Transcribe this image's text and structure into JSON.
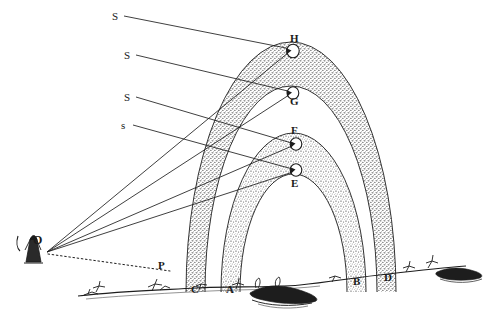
{
  "figure": {
    "ink_color": "#1d1d1d",
    "stipple_color": "#3a3a3a",
    "background": "#ffffff"
  },
  "sun_ray_labels": [
    {
      "id": "s1",
      "text": "S",
      "x": 112,
      "y": 11
    },
    {
      "id": "s2",
      "text": "S",
      "x": 124,
      "y": 50
    },
    {
      "id": "s3",
      "text": "S",
      "x": 124,
      "y": 92
    },
    {
      "id": "s4",
      "text": "s",
      "x": 121,
      "y": 120
    }
  ],
  "drop_labels": [
    {
      "id": "H",
      "text": "H",
      "x": 290,
      "y": 33
    },
    {
      "id": "G",
      "text": "G",
      "x": 290,
      "y": 96
    },
    {
      "id": "F",
      "text": "F",
      "x": 291,
      "y": 125
    },
    {
      "id": "E",
      "text": "E",
      "x": 291,
      "y": 178
    }
  ],
  "ground_labels": [
    {
      "id": "C",
      "text": "C",
      "x": 191,
      "y": 284
    },
    {
      "id": "A",
      "text": "A",
      "x": 226,
      "y": 284
    },
    {
      "id": "B",
      "text": "B",
      "x": 353,
      "y": 276
    },
    {
      "id": "D",
      "text": "D",
      "x": 384,
      "y": 272
    }
  ],
  "observer": {
    "label": "O",
    "label_x": 33,
    "label_y": 234,
    "eye_x": 46,
    "eye_y": 253
  },
  "horizon_point": {
    "label": "P",
    "label_x": 158,
    "label_y": 260
  },
  "arcs": {
    "secondary": {
      "name": "secondary-bow",
      "left_foot_label": "C",
      "right_foot_label": "D",
      "outer_left_x": 186,
      "outer_right_x": 396,
      "apex_y": 42
    },
    "primary": {
      "name": "primary-bow",
      "left_foot_label": "A",
      "right_foot_label": "B",
      "outer_left_x": 221,
      "outer_right_x": 366,
      "apex_y": 133
    }
  },
  "rays": [
    {
      "from": "S",
      "to": "H"
    },
    {
      "from": "S",
      "to": "G"
    },
    {
      "from": "S",
      "to": "F"
    },
    {
      "from": "s",
      "to": "E"
    },
    {
      "from": "H",
      "to": "O"
    },
    {
      "from": "G",
      "to": "O"
    },
    {
      "from": "F",
      "to": "O"
    },
    {
      "from": "E",
      "to": "O"
    },
    {
      "from": "O",
      "to": "P",
      "style": "dotted"
    }
  ]
}
